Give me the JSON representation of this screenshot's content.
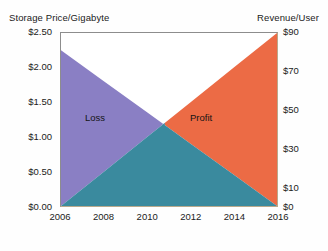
{
  "chart_data": {
    "type": "area",
    "title": "",
    "subtitle": "",
    "xlabel": "",
    "ylabel": "Storage Price/Gigabyte",
    "y2label": "Revenue/User",
    "x": [
      2006,
      2008,
      2010,
      2012,
      2014,
      2016
    ],
    "xlim": [
      2006,
      2016
    ],
    "ylim": [
      0.0,
      2.5
    ],
    "y2lim": [
      0,
      90
    ],
    "grid": false,
    "legend_position": "none",
    "series": [
      {
        "name": "Storage Price/Gigabyte",
        "axis": "left",
        "units": "USD per gigabyte",
        "x": [
          2006,
          2008,
          2010,
          2012,
          2014,
          2016
        ],
        "values": [
          2.25,
          1.8,
          1.35,
          0.9,
          0.45,
          0.0
        ],
        "trend": "decreasing",
        "fill_color": "#8a7fc4"
      },
      {
        "name": "Revenue/User",
        "axis": "right",
        "units": "USD per user",
        "x": [
          2006,
          2008,
          2010,
          2012,
          2014,
          2016
        ],
        "values": [
          0,
          18,
          36,
          54,
          72,
          90
        ],
        "trend": "increasing",
        "fill_color": "#ec6b45"
      }
    ],
    "regions": [
      {
        "name": "Loss",
        "label": "Loss",
        "color": "#8a7fc4",
        "x_range": [
          2006,
          2010.8
        ]
      },
      {
        "name": "Profit",
        "label": "Profit",
        "color": "#ec6b45",
        "x_range": [
          2010.8,
          2016
        ]
      },
      {
        "name": "Overlap",
        "label": "",
        "color": "#3a8a9e",
        "x_range": [
          2006,
          2016
        ]
      }
    ],
    "crossover": {
      "year": 2010.8,
      "price": 1.28,
      "revenue": 43
    },
    "annotations": [
      {
        "text": "Loss",
        "x": 2007.9,
        "y": 1.3
      },
      {
        "text": "Profit",
        "x": 2012.8,
        "y": 1.3
      }
    ],
    "ticks": {
      "left": [
        "$2.50",
        "$2.00",
        "$1.50",
        "$1.00",
        "$0.50",
        "$0.00"
      ],
      "left_values": [
        2.5,
        2.0,
        1.5,
        1.0,
        0.5,
        0.0
      ],
      "right": [
        "$90",
        "$70",
        "$50",
        "$30",
        "$10",
        "$0"
      ],
      "right_values": [
        90,
        70,
        50,
        30,
        10,
        0
      ],
      "x": [
        "2006",
        "2008",
        "2010",
        "2012",
        "2014",
        "2016"
      ]
    }
  },
  "axis_titles": {
    "left": "Storage Price/Gigabyte",
    "right": "Revenue/User"
  },
  "colors": {
    "loss": "#8a7fc4",
    "profit": "#ec6b45",
    "overlap": "#3a8a9e",
    "plot_background": "#ffffff",
    "frame": "#8d8d8d",
    "text": "#1b1b1b"
  }
}
